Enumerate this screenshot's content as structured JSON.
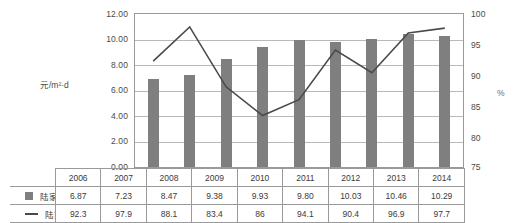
{
  "chart_data": {
    "type": "bar",
    "title": "",
    "xlabel": "",
    "ylabel": "元/m²·d",
    "y2label": "%",
    "ylim": [
      0,
      12
    ],
    "y2lim": [
      75,
      100
    ],
    "grid": true,
    "legend_position": "table-bottom",
    "categories": [
      "2006",
      "2007",
      "2008",
      "2009",
      "2010",
      "2011",
      "2012",
      "2013",
      "2014"
    ],
    "series": [
      {
        "name": "陆家嘴中心区平均租金",
        "type": "bar",
        "axis": "left",
        "color": "#7f7f7f",
        "values": [
          6.87,
          7.23,
          8.47,
          9.38,
          9.93,
          9.8,
          10.03,
          10.46,
          10.29
        ],
        "labels": [
          "6.87",
          "7.23",
          "8.47",
          "9.38",
          "9.93",
          "9.80",
          "10.03",
          "10.46",
          "10.29"
        ]
      },
      {
        "name": "陆家嘴中心区入驻率",
        "type": "line",
        "axis": "right",
        "color": "#4a4a4a",
        "values": [
          92.3,
          97.9,
          88.1,
          83.4,
          86,
          94.1,
          90.4,
          96.9,
          97.7
        ],
        "labels": [
          "92.3",
          "97.9",
          "88.1",
          "83.4",
          "86",
          "94.1",
          "90.4",
          "96.9",
          "97.7"
        ]
      }
    ],
    "yticks": [
      "0.00",
      "2.00",
      "4.00",
      "6.00",
      "8.00",
      "10.00",
      "12.00"
    ],
    "y2ticks": [
      "75",
      "80",
      "85",
      "90",
      "95",
      "100"
    ]
  },
  "axes": {
    "left_title": "元/m²·d",
    "right_title": "%",
    "left_ticks": [
      {
        "label": "12.00",
        "value": 12
      },
      {
        "label": "10.00",
        "value": 10
      },
      {
        "label": "8.00",
        "value": 8
      },
      {
        "label": "6.00",
        "value": 6
      },
      {
        "label": "4.00",
        "value": 4
      },
      {
        "label": "2.00",
        "value": 2
      },
      {
        "label": "0.00",
        "value": 0
      }
    ],
    "right_ticks": [
      {
        "label": "100",
        "value": 100
      },
      {
        "label": "95",
        "value": 95
      },
      {
        "label": "90",
        "value": 90
      },
      {
        "label": "85",
        "value": 85
      },
      {
        "label": "80",
        "value": 80
      },
      {
        "label": "75",
        "value": 75
      }
    ]
  },
  "table": {
    "year_row": [
      "2006",
      "2007",
      "2008",
      "2009",
      "2010",
      "2011",
      "2012",
      "2013",
      "2014"
    ],
    "rows": [
      {
        "marker": "bar-swatch",
        "label": "陆家嘴中心区平均租金",
        "values": [
          "6.87",
          "7.23",
          "8.47",
          "9.38",
          "9.93",
          "9.80",
          "10.03",
          "10.46",
          "10.29"
        ]
      },
      {
        "marker": "line-swatch",
        "label": "陆家嘴中心区入驻率",
        "values": [
          "92.3",
          "97.9",
          "88.1",
          "83.4",
          "86",
          "94.1",
          "90.4",
          "96.9",
          "97.7"
        ]
      }
    ]
  }
}
